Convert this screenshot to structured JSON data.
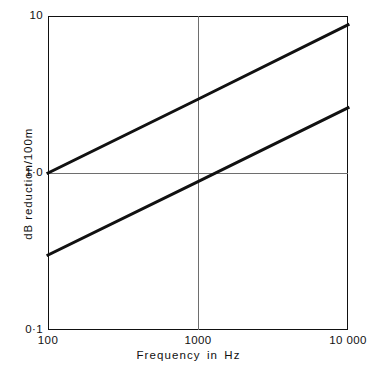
{
  "chart_data": {
    "type": "line",
    "title": "",
    "xlabel": "Frequency in Hz",
    "ylabel": "dB reduction/100m",
    "xscale": "log",
    "yscale": "log",
    "xlim": [
      100,
      10000
    ],
    "ylim": [
      0.1,
      10
    ],
    "grid": true,
    "legend": "none",
    "x_ticks": [
      {
        "value": 100,
        "label": "100"
      },
      {
        "value": 1000,
        "label": "1000"
      },
      {
        "value": 10000,
        "label": "10 000"
      }
    ],
    "y_ticks": [
      {
        "value": 0.1,
        "label": "0·1"
      },
      {
        "value": 1.0,
        "label": "1·0"
      },
      {
        "value": 10,
        "label": "10"
      }
    ],
    "gridlines": {
      "horizontal": [
        1.0
      ],
      "vertical": [
        1000
      ]
    },
    "series": [
      {
        "name": "upper-attenuation-line",
        "x": [
          100,
          1000,
          10000
        ],
        "values": [
          1.0,
          2.95,
          8.8
        ]
      },
      {
        "name": "lower-attenuation-line",
        "x": [
          100,
          1000,
          10000
        ],
        "values": [
          0.3,
          0.88,
          2.6
        ]
      }
    ],
    "colors": {
      "line": "#111111",
      "axis": "#111111",
      "grid": "#6e6e6e",
      "background": "#ffffff"
    }
  }
}
